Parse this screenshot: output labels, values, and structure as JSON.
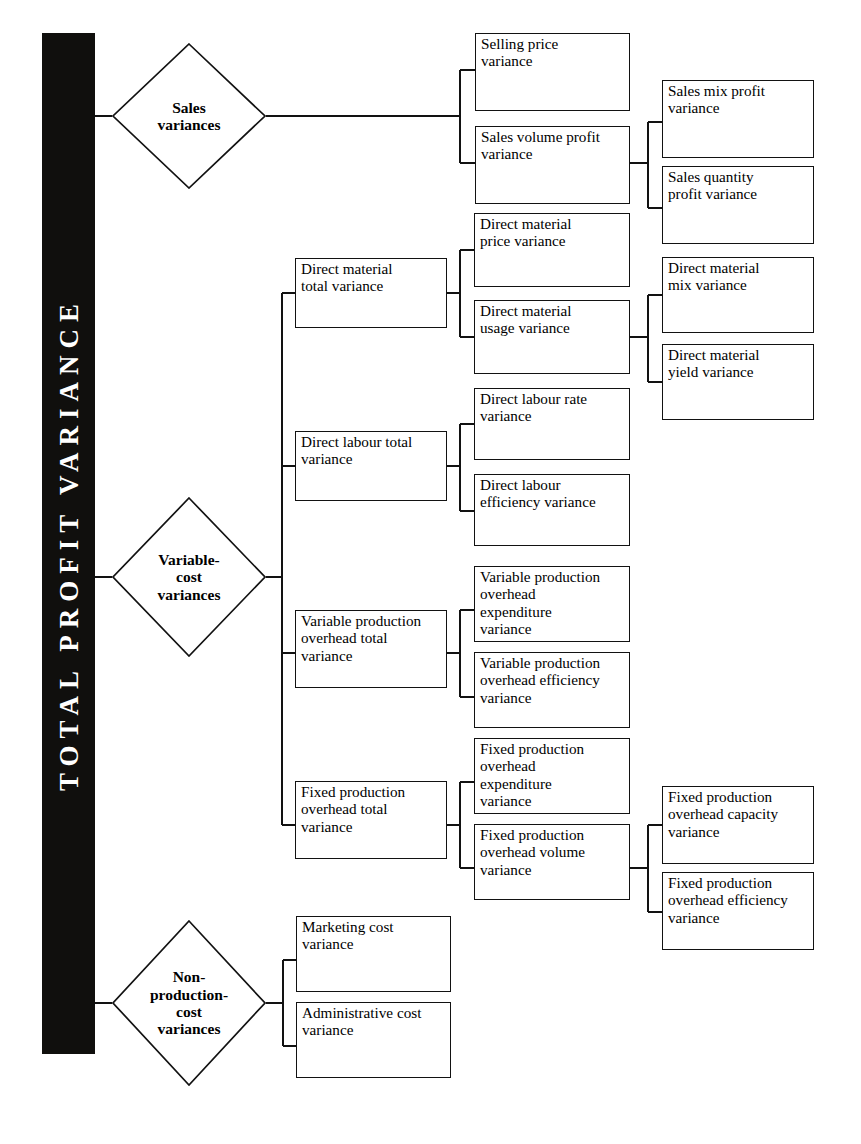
{
  "diagram": {
    "title": "TOTAL PROFIT VARIANCE",
    "root_label": "TOTAL PROFIT VARIANCE",
    "type": "tree",
    "orientation": "left-to-right",
    "levels": 4,
    "colors": {
      "root_fill": "#100f0d",
      "root_text": "#ffffff",
      "box_stroke": "#121212",
      "box_fill": "#ffffff",
      "text": "#000000"
    }
  },
  "branches": [
    {
      "id": "sales",
      "label": "Sales\nvariances",
      "shape": "diamond",
      "children": [
        {
          "id": "selling-price-variance",
          "label": "Selling price\nvariance",
          "shape": "rect",
          "children": []
        },
        {
          "id": "sales-volume-profit-variance",
          "label": "Sales volume profit\nvariance",
          "shape": "rect",
          "children": [
            {
              "id": "sales-mix-profit-variance",
              "label": "Sales mix profit\nvariance",
              "shape": "rect"
            },
            {
              "id": "sales-quantity-profit-variance",
              "label": "Sales quantity\nprofit variance",
              "shape": "rect"
            }
          ]
        }
      ]
    },
    {
      "id": "variable-cost",
      "label": "Variable-\ncost\nvariances",
      "shape": "diamond",
      "children": [
        {
          "id": "direct-material-total-variance",
          "label": "Direct material\ntotal variance",
          "shape": "rect",
          "children": [
            {
              "id": "direct-material-price-variance",
              "label": "Direct material\nprice variance",
              "shape": "rect"
            },
            {
              "id": "direct-material-usage-variance",
              "label": "Direct material\nusage variance",
              "shape": "rect",
              "children": [
                {
                  "id": "direct-material-mix-variance",
                  "label": "Direct material\nmix variance",
                  "shape": "rect"
                },
                {
                  "id": "direct-material-yield-variance",
                  "label": "Direct material\nyield variance",
                  "shape": "rect"
                }
              ]
            }
          ]
        },
        {
          "id": "direct-labour-total-variance",
          "label": "Direct labour total\nvariance",
          "shape": "rect",
          "children": [
            {
              "id": "direct-labour-rate-variance",
              "label": "Direct labour rate\nvariance",
              "shape": "rect"
            },
            {
              "id": "direct-labour-efficiency-variance",
              "label": "Direct labour\nefficiency variance",
              "shape": "rect"
            }
          ]
        },
        {
          "id": "variable-production-overhead-total-variance",
          "label": "Variable production\noverhead total\nvariance",
          "shape": "rect",
          "children": [
            {
              "id": "variable-production-overhead-expenditure-variance",
              "label": "Variable production\noverhead\nexpenditure\nvariance",
              "shape": "rect"
            },
            {
              "id": "variable-production-overhead-efficiency-variance",
              "label": "Variable production\noverhead efficiency\nvariance",
              "shape": "rect"
            }
          ]
        },
        {
          "id": "fixed-production-overhead-total-variance",
          "label": "Fixed production\noverhead total\nvariance",
          "shape": "rect",
          "children": [
            {
              "id": "fixed-production-overhead-expenditure-variance",
              "label": "Fixed production\noverhead\nexpenditure\nvariance",
              "shape": "rect"
            },
            {
              "id": "fixed-production-overhead-volume-variance",
              "label": "Fixed production\noverhead volume\nvariance",
              "shape": "rect",
              "children": [
                {
                  "id": "fixed-production-overhead-capacity-variance",
                  "label": "Fixed production\noverhead capacity\nvariance",
                  "shape": "rect"
                },
                {
                  "id": "fixed-production-overhead-efficiency-variance",
                  "label": "Fixed production\noverhead efficiency\nvariance",
                  "shape": "rect"
                }
              ]
            }
          ]
        }
      ]
    },
    {
      "id": "non-production-cost",
      "label": "Non-\nproduction-\ncost\nvariances",
      "shape": "diamond",
      "children": [
        {
          "id": "marketing-cost-variance",
          "label": "Marketing cost\nvariance",
          "shape": "rect"
        },
        {
          "id": "administrative-cost-variance",
          "label": "Administrative cost\nvariance",
          "shape": "rect"
        }
      ]
    }
  ],
  "nodes": {
    "sales_variances": "Sales\nvariances",
    "variable_cost_variances": "Variable-\ncost\nvariances",
    "non_production_cost_variances": "Non-\nproduction-\ncost\nvariances",
    "selling_price_variance": "Selling price\nvariance",
    "sales_volume_profit_variance": "Sales volume profit\nvariance",
    "sales_mix_profit_variance": "Sales mix profit\nvariance",
    "sales_quantity_profit_variance": "Sales quantity\nprofit variance",
    "direct_material_total_variance": "Direct material\ntotal variance",
    "direct_material_price_variance": "Direct material\nprice variance",
    "direct_material_usage_variance": "Direct material\nusage variance",
    "direct_material_mix_variance": "Direct material\nmix variance",
    "direct_material_yield_variance": "Direct material\nyield variance",
    "direct_labour_total_variance": "Direct labour total\nvariance",
    "direct_labour_rate_variance": "Direct labour rate\nvariance",
    "direct_labour_efficiency_variance": "Direct labour\nefficiency variance",
    "variable_production_overhead_total_variance": "Variable production\noverhead total\nvariance",
    "variable_production_overhead_expenditure_variance": "Variable production\noverhead\nexpenditure\nvariance",
    "variable_production_overhead_efficiency_variance": "Variable production\noverhead efficiency\nvariance",
    "fixed_production_overhead_total_variance": "Fixed production\noverhead total\nvariance",
    "fixed_production_overhead_expenditure_variance": "Fixed production\noverhead\nexpenditure\nvariance",
    "fixed_production_overhead_volume_variance": "Fixed production\noverhead volume\nvariance",
    "fixed_production_overhead_capacity_variance": "Fixed production\noverhead capacity\nvariance",
    "fixed_production_overhead_efficiency_variance": "Fixed production\noverhead efficiency\nvariance",
    "marketing_cost_variance": "Marketing cost\nvariance",
    "administrative_cost_variance": "Administrative cost\nvariance"
  }
}
